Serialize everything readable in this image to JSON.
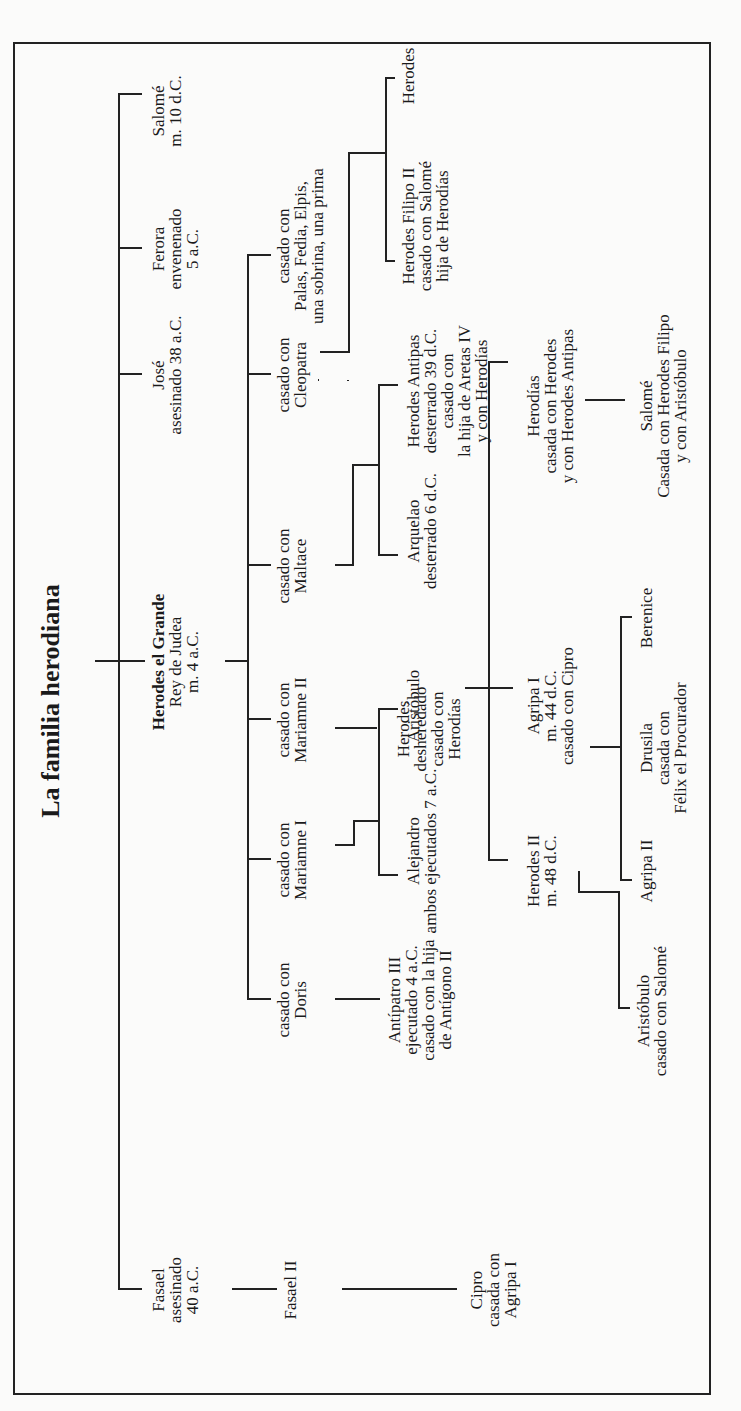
{
  "title": "La familia herodiana",
  "generation1": [
    {
      "id": "fasael",
      "lines": [
        "Fasael",
        "asesinado",
        "40 a.C."
      ]
    },
    {
      "id": "herodes_grande",
      "lines": [
        "Herodes el Grande",
        "Rey de Judea",
        "m. 4 a.C."
      ],
      "bold_first": true
    },
    {
      "id": "jose",
      "lines": [
        "José",
        "asesinado 38 a.C."
      ]
    },
    {
      "id": "ferora",
      "lines": [
        "Ferora",
        "envenenado",
        "5 a.C."
      ]
    },
    {
      "id": "salome",
      "lines": [
        "Salomé",
        "m. 10 d.C."
      ]
    }
  ],
  "wives": [
    {
      "id": "doris",
      "lines": [
        "casado con",
        "Doris"
      ]
    },
    {
      "id": "mariamne1",
      "lines": [
        "casado con",
        "Mariamne I"
      ]
    },
    {
      "id": "mariamne2",
      "lines": [
        "casado con",
        "Mariamne II"
      ]
    },
    {
      "id": "maltace",
      "lines": [
        "casado con",
        "Maltace"
      ]
    },
    {
      "id": "cleopatra",
      "lines": [
        "casado con",
        "Cleopatra"
      ]
    },
    {
      "id": "others",
      "lines": [
        "casado con",
        "Palas, Fedia, Elpis,",
        "una sobrina, una prima"
      ]
    }
  ],
  "generation2": [
    {
      "id": "fasael2",
      "lines": [
        "Fasael II"
      ]
    },
    {
      "id": "antipatro3",
      "lines": [
        "Antípatro III",
        "ejecutado 4 a.C.",
        "casado con la hija",
        "de Antígono II"
      ]
    },
    {
      "id": "alejandro",
      "lines": [
        "Alejandro",
        "ambos ejecutados 7 a.C."
      ]
    },
    {
      "id": "aristobulo",
      "lines": [
        "Aristóbulo",
        ""
      ]
    },
    {
      "id": "herodes_desheredado",
      "lines": [
        "Herodes",
        "desheredado",
        "casado con",
        "Herodías"
      ]
    },
    {
      "id": "arquelao",
      "lines": [
        "Arquelao",
        "desterrado 6 d.C."
      ]
    },
    {
      "id": "antipas",
      "lines": [
        "Herodes Antipas",
        "desterrado 39 d.C.",
        "casado con",
        "la hija de Aretas IV",
        "y con Herodías"
      ]
    },
    {
      "id": "filipo2",
      "lines": [
        "Herodes Filipo II",
        "casado con Salomé",
        "hija de Herodías"
      ]
    },
    {
      "id": "herodes_cleo",
      "lines": [
        "Herodes"
      ]
    }
  ],
  "generation3": [
    {
      "id": "cipro",
      "lines": [
        "Cipro",
        "casada con",
        "Agripa I"
      ]
    },
    {
      "id": "herodes2",
      "lines": [
        "Herodes II",
        "m. 48 d.C."
      ]
    },
    {
      "id": "agripa1",
      "lines": [
        "Agripa I",
        "m. 44 d.C.",
        "casado con Cipro"
      ]
    },
    {
      "id": "herodias",
      "lines": [
        "Herodías",
        "casada con Herodes",
        "y con Herodes Antipas"
      ]
    }
  ],
  "generation4": [
    {
      "id": "aristobulo_jr",
      "lines": [
        "Aristóbulo",
        "casado con Salomé"
      ]
    },
    {
      "id": "agripa2",
      "lines": [
        "Agripa II"
      ]
    },
    {
      "id": "drusila",
      "lines": [
        "Drusila",
        "casada con",
        "Félix el Procurador"
      ]
    },
    {
      "id": "berenice",
      "lines": [
        "Berenice"
      ]
    },
    {
      "id": "salome_jr",
      "lines": [
        "Salomé",
        "Casada con Herodes Filipo",
        "y con Aristóbulo"
      ]
    }
  ]
}
